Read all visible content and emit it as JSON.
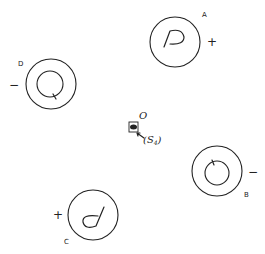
{
  "diagram": {
    "center": {
      "label": "O",
      "source_label": "(S",
      "source_subscript": "4",
      "source_close": ")"
    },
    "units": [
      {
        "id": "A",
        "label": "A",
        "sign": "+",
        "inner": "P-shaped trace"
      },
      {
        "id": "B",
        "label": "B",
        "sign": "−",
        "inner": "small circle with tick at top"
      },
      {
        "id": "C",
        "label": "C",
        "sign": "+",
        "inner": "d-shaped trace"
      },
      {
        "id": "D",
        "label": "D",
        "sign": "−",
        "inner": "small circle with tick at bottom"
      }
    ]
  }
}
